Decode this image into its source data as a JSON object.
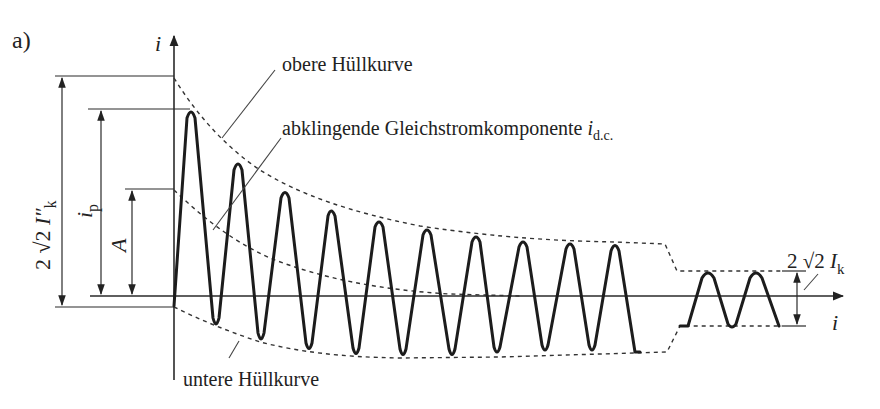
{
  "figure": {
    "panel_label": "a)",
    "y_axis_label": "i",
    "x_axis_label": "i",
    "annotations": {
      "upper_envelope": "obere Hüllkurve",
      "dc_component_prefix": "abklingende Gleichstromkomponente ",
      "dc_component_symbol": "i",
      "dc_component_subscript": "d.c.",
      "lower_envelope": "untere Hüllkurve"
    },
    "dimensions": {
      "initial_peak_to_peak": {
        "prefix": "2 √2 ",
        "symbol": "I″",
        "subscript": "k"
      },
      "peak_current": {
        "symbol": "i",
        "subscript": "p"
      },
      "dc_offset": {
        "symbol": "A"
      },
      "steady_state_peak_to_peak": {
        "prefix": "2 √2 ",
        "symbol": "I",
        "subscript": "k"
      }
    },
    "colors": {
      "background": "#ffffff",
      "waveform": "#1c1c1c",
      "lines": "#2a2a2a"
    }
  }
}
